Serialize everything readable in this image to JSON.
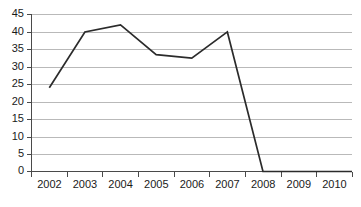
{
  "chart_data": {
    "type": "line",
    "title": "",
    "subtitle": "",
    "xlabel": "",
    "ylabel": "",
    "categories": [
      "2002",
      "2003",
      "2004",
      "2005",
      "2006",
      "2007",
      "2008",
      "2009",
      "2010"
    ],
    "x": [
      2002,
      2003,
      2004,
      2005,
      2006,
      2007,
      2008,
      2009,
      2010
    ],
    "series": [
      {
        "name": "",
        "values": [
          24,
          40,
          42,
          33.5,
          32.5,
          40,
          0,
          0,
          0
        ]
      }
    ],
    "values": [
      24,
      40,
      42,
      33.5,
      32.5,
      40,
      0,
      0,
      0
    ],
    "ylim": [
      0,
      45
    ],
    "yticks": [
      0,
      5,
      10,
      15,
      20,
      25,
      30,
      35,
      40,
      45
    ],
    "ytick_labels": [
      "0",
      "5",
      "10",
      "15",
      "20",
      "25",
      "30",
      "35",
      "40",
      "45"
    ],
    "xtick_labels": [
      "2002",
      "2003",
      "2004",
      "2005",
      "2006",
      "2007",
      "2008",
      "2009",
      "2010"
    ],
    "grid": true,
    "grid_axis": "y",
    "legend": false,
    "legend_position": "none",
    "annotations": [],
    "colors": {
      "line": "#2b2b2b",
      "grid": "#b9b9b9",
      "axis": "#4a4a4a",
      "text": "#1a1a1a",
      "background": "#ffffff"
    }
  }
}
